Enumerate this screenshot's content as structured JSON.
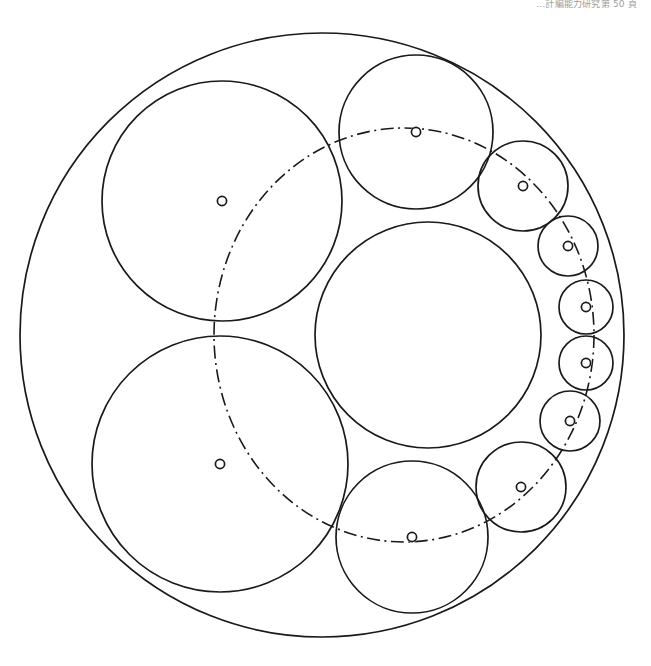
{
  "page": {
    "width": 651,
    "height": 666,
    "background_color": "#ffffff",
    "stroke_color": "#1a1a1a",
    "header_note": "…計編能力研究第 50 頁"
  },
  "figure": {
    "type": "geometric-construction",
    "line_style_main": "solid",
    "line_style_locus": "dash-dot"
  },
  "chart_data": {
    "type": "scatter",
    "xlabel": "",
    "ylabel": "",
    "xlim": [
      0,
      651
    ],
    "ylim": [
      0,
      666
    ],
    "grid": false,
    "legend": "none",
    "outer_circle": {
      "name": "outer-boundary-circle",
      "cx": 322,
      "cy": 335,
      "r": 302,
      "stroke_width": 1.7
    },
    "inner_circle": {
      "name": "inner-core-circle",
      "cx": 428,
      "cy": 335,
      "r": 113,
      "stroke_width": 1.7
    },
    "chain_circles": [
      {
        "name": "chain-circle-1",
        "cx": 222,
        "cy": 201,
        "r": 120,
        "stroke_width": 1.7
      },
      {
        "name": "chain-circle-2",
        "cx": 416,
        "cy": 132,
        "r": 77,
        "stroke_width": 1.7
      },
      {
        "name": "chain-circle-3",
        "cx": 523,
        "cy": 186,
        "r": 45,
        "stroke_width": 1.7
      },
      {
        "name": "chain-circle-4",
        "cx": 568,
        "cy": 246,
        "r": 30,
        "stroke_width": 1.7
      },
      {
        "name": "chain-circle-5",
        "cx": 586,
        "cy": 307,
        "r": 27,
        "stroke_width": 1.7
      },
      {
        "name": "chain-circle-6",
        "cx": 586,
        "cy": 363,
        "r": 27,
        "stroke_width": 1.7
      },
      {
        "name": "chain-circle-7",
        "cx": 570,
        "cy": 421,
        "r": 30,
        "stroke_width": 1.7
      },
      {
        "name": "chain-circle-8",
        "cx": 521,
        "cy": 487,
        "r": 45,
        "stroke_width": 1.7
      },
      {
        "name": "chain-circle-9",
        "cx": 412,
        "cy": 537,
        "r": 76,
        "stroke_width": 1.7
      },
      {
        "name": "chain-circle-10",
        "cx": 220,
        "cy": 464,
        "r": 128,
        "stroke_width": 1.7
      }
    ],
    "center_markers": [
      {
        "name": "center-marker-1",
        "cx": 222,
        "cy": 201,
        "r": 4.6
      },
      {
        "name": "center-marker-2",
        "cx": 416,
        "cy": 132,
        "r": 4.6
      },
      {
        "name": "center-marker-3",
        "cx": 523,
        "cy": 186,
        "r": 4.6
      },
      {
        "name": "center-marker-4",
        "cx": 568,
        "cy": 246,
        "r": 4.6
      },
      {
        "name": "center-marker-5",
        "cx": 586,
        "cy": 307,
        "r": 4.6
      },
      {
        "name": "center-marker-6",
        "cx": 586,
        "cy": 363,
        "r": 4.6
      },
      {
        "name": "center-marker-7",
        "cx": 570,
        "cy": 421,
        "r": 4.6
      },
      {
        "name": "center-marker-8",
        "cx": 521,
        "cy": 487,
        "r": 4.6
      },
      {
        "name": "center-marker-9",
        "cx": 412,
        "cy": 537,
        "r": 4.6
      },
      {
        "name": "center-marker-10",
        "cx": 220,
        "cy": 464,
        "r": 4.6
      }
    ],
    "locus_ellipse": {
      "name": "center-locus-ellipse",
      "cx": 404,
      "cy": 335,
      "rx": 190,
      "ry": 207,
      "rotation_deg": 0,
      "style": "dash-dot",
      "description": "Locus through all chain-circle centres"
    }
  }
}
